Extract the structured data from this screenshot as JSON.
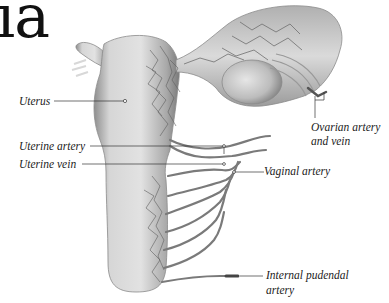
{
  "title": "ia",
  "labels": {
    "uterus": "Uterus",
    "uterine_artery": "Uterine artery",
    "uterine_vein": "Uterine vein",
    "ovarian_line1": "Ovarian artery",
    "ovarian_line2": "and vein",
    "vaginal_artery": "Vaginal artery",
    "pudendal_line1": "Internal pudendal",
    "pudendal_line2": "artery"
  },
  "colors": {
    "background": "#ffffff",
    "organ_fill": "#cfcfcf",
    "organ_shade": "#9a9a9a",
    "vessel": "#6e6e6e",
    "leader_line": "#333333"
  }
}
